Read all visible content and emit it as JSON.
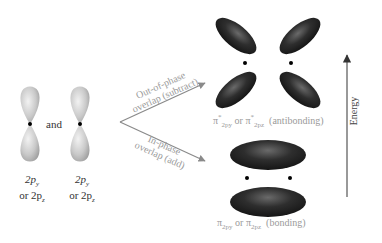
{
  "left": {
    "orbital1_label_line1": "2p",
    "orbital1_label_line1_sub": "y",
    "orbital1_label_line2": "or 2p",
    "orbital1_label_line2_sub": "z",
    "orbital2_label_line1": "2p",
    "orbital2_label_line1_sub": "y",
    "orbital2_label_line2": "or 2p",
    "orbital2_label_line2_sub": "z",
    "and": "and"
  },
  "arrows": {
    "out_of_phase_line1": "Out-of-phase",
    "out_of_phase_line2": "overlap (subtract)",
    "in_phase_line1": "In-phase",
    "in_phase_line2": "overlap (add)"
  },
  "antibonding": {
    "symbol": "π",
    "sup": "*",
    "sub1": "2p",
    "sub1_sub": "y",
    "or": "or",
    "sub2": "2p",
    "sub2_sub": "z",
    "desc": "(antibonding)"
  },
  "bonding": {
    "symbol": "π",
    "sub1": "2p",
    "sub1_sub": "y",
    "or": "or",
    "sub2": "2p",
    "sub2_sub": "z",
    "desc": "(bonding)"
  },
  "energy_axis": {
    "label": "Energy"
  },
  "colors": {
    "p_orbital": "#c8c8c8",
    "pi_lobe": "#2a2a2a",
    "arrow": "#8a8a8a",
    "label_gray": "#9a9a9a",
    "axis": "#555555"
  }
}
